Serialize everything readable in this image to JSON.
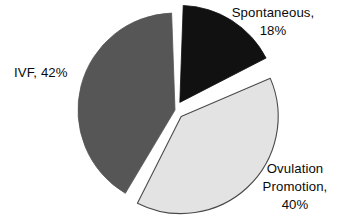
{
  "figure": {
    "background_color": "#ffffff",
    "width": 342,
    "height": 223
  },
  "chart_data": {
    "type": "pie",
    "title": "",
    "xlabel": "",
    "ylabel": "",
    "legend_position": "none",
    "grid": false,
    "labels_mode": "outside-callout-text",
    "units": "%",
    "categories": [
      "Spontaneous",
      "Ovulation Promotion",
      "IVF"
    ],
    "values": [
      18,
      40,
      42
    ],
    "annotations": [
      "Spontaneous, 18%",
      "Ovulation Promotion, 40%",
      "IVF, 42%"
    ],
    "slices": [
      {
        "name": "Spontaneous",
        "value": 18,
        "value_text": "18%",
        "label_text": "Spontaneous,",
        "color": "#111111",
        "edge_color": "#111111",
        "exploded": true,
        "start_angle_deg": 0,
        "end_angle_deg": 64.8
      },
      {
        "name": "Ovulation Promotion",
        "value": 40,
        "value_text": "40%",
        "label_line1": "Ovulation",
        "label_line2": "Promotion,",
        "color": "#e3e3e3",
        "edge_color": "#4a4a4a",
        "exploded": true,
        "start_angle_deg": 64.8,
        "end_angle_deg": 208.8
      },
      {
        "name": "IVF",
        "value": 42,
        "value_text": "42%",
        "label_text": "IVF, 42%",
        "color": "#565656",
        "edge_color": "#565656",
        "exploded": false,
        "start_angle_deg": 208.8,
        "end_angle_deg": 360
      }
    ]
  },
  "labels": {
    "spontaneous": {
      "line1": "Spontaneous,",
      "line2": "18%"
    },
    "ivf": {
      "line1": "IVF, 42%"
    },
    "ovulation": {
      "line1": "Ovulation",
      "line2": "Promotion,",
      "line3": "40%"
    }
  },
  "colors": {
    "spontaneous_slice": "#111111",
    "ovulation_slice": "#e3e3e3",
    "ovulation_outline": "#4a4a4a",
    "ivf_slice": "#565656",
    "text": "#0a0a0a",
    "background": "#ffffff"
  }
}
